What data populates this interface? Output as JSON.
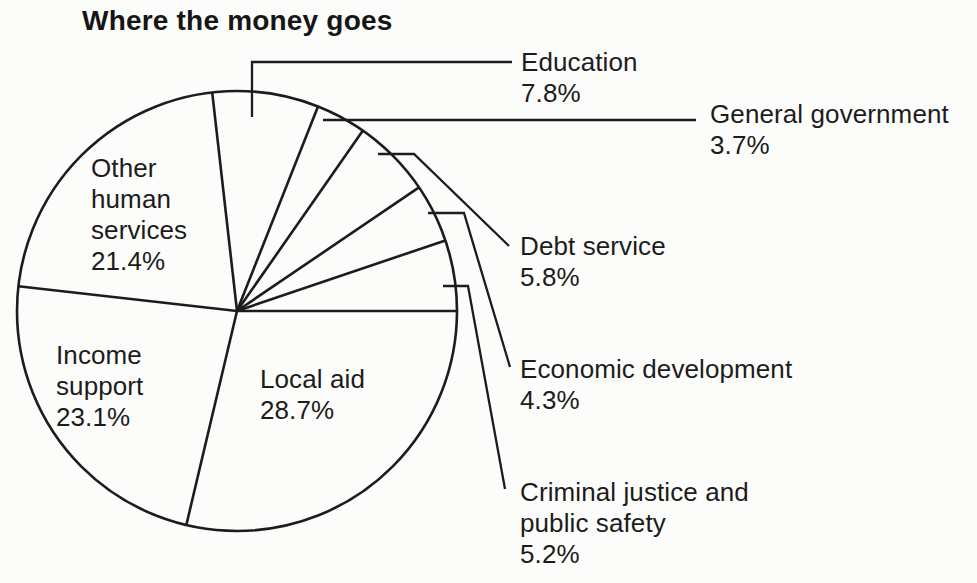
{
  "title": "Where the money goes",
  "chart_data": {
    "type": "pie",
    "title": "Where the money goes",
    "units": "percent of total",
    "style": "outline-only line art: white slices, dark outlines, no fills",
    "direction": "clockwise",
    "start_angle_deg": 96.48,
    "legend_position": "callout labels right of pie, large-slice labels inside pie",
    "colors": {
      "ink": "#1c1c1c",
      "background": "#fcfcfa"
    },
    "slices": [
      {
        "label": "Education",
        "value": 7.8,
        "pct": "7.8%",
        "label_lines": [
          "Education"
        ],
        "label_position": "callout"
      },
      {
        "label": "General government",
        "value": 3.7,
        "pct": "3.7%",
        "label_lines": [
          "General government"
        ],
        "label_position": "callout"
      },
      {
        "label": "Debt service",
        "value": 5.8,
        "pct": "5.8%",
        "label_lines": [
          "Debt service"
        ],
        "label_position": "callout"
      },
      {
        "label": "Economic development",
        "value": 4.3,
        "pct": "4.3%",
        "label_lines": [
          "Economic development"
        ],
        "label_position": "callout"
      },
      {
        "label": "Criminal justice and public safety",
        "value": 5.2,
        "pct": "5.2%",
        "label_lines": [
          "Criminal justice and",
          "public safety"
        ],
        "label_position": "callout"
      },
      {
        "label": "Local aid",
        "value": 28.7,
        "pct": "28.7%",
        "label_lines": [
          "Local aid"
        ],
        "label_position": "inside"
      },
      {
        "label": "Income support",
        "value": 23.1,
        "pct": "23.1%",
        "label_lines": [
          "Income",
          "support"
        ],
        "label_position": "inside"
      },
      {
        "label": "Other human services",
        "value": 21.4,
        "pct": "21.4%",
        "label_lines": [
          "Other",
          "human",
          "services"
        ],
        "label_position": "inside"
      }
    ]
  }
}
